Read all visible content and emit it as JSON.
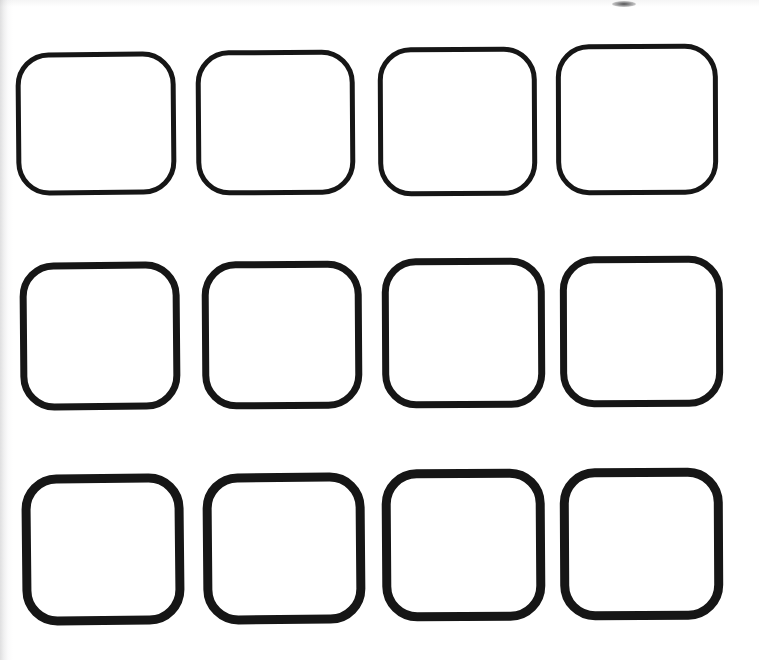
{
  "document": {
    "kind": "scanned-worksheet",
    "title": "Blank rounded-square grid template",
    "background_color": "#ffffff",
    "ink_color": "#161616",
    "page_width": 759,
    "page_height": 660,
    "rows": 3,
    "columns": 4,
    "shape_count": 12,
    "shape_type": "rounded-square-outline",
    "shape_fill": "none"
  },
  "artifacts": {
    "left_edge_shadow": "scan shadow, vertical gray gradient on left margin",
    "top_edge_shadow": "scan shadow, faint gray band at top margin",
    "top_smudge": {
      "label": "ink speck",
      "x": 612,
      "y": 1,
      "width": 24,
      "height": 6
    }
  },
  "grid": {
    "rows": [
      {
        "index": 0,
        "label": "row-1",
        "stroke_width": 5,
        "cells": [
          {
            "label": "cell-r1c1",
            "x": 16,
            "y": 52,
            "width": 160,
            "height": 143,
            "radius": 33,
            "rotation": -0.5
          },
          {
            "label": "cell-r1c2",
            "x": 196,
            "y": 50,
            "width": 159,
            "height": 145,
            "radius": 33,
            "rotation": -0.4
          },
          {
            "label": "cell-r1c3",
            "x": 378,
            "y": 47,
            "width": 159,
            "height": 149,
            "radius": 33,
            "rotation": -0.3
          },
          {
            "label": "cell-r1c4",
            "x": 556,
            "y": 44,
            "width": 162,
            "height": 151,
            "radius": 33,
            "rotation": -0.2
          }
        ]
      },
      {
        "index": 1,
        "label": "row-2",
        "stroke_width": 7,
        "cells": [
          {
            "label": "cell-r2c1",
            "x": 20,
            "y": 262,
            "width": 160,
            "height": 148,
            "radius": 34,
            "rotation": -0.5
          },
          {
            "label": "cell-r2c2",
            "x": 202,
            "y": 261,
            "width": 160,
            "height": 148,
            "radius": 34,
            "rotation": -0.4
          },
          {
            "label": "cell-r2c3",
            "x": 382,
            "y": 258,
            "width": 163,
            "height": 150,
            "radius": 34,
            "rotation": -0.3
          },
          {
            "label": "cell-r2c4",
            "x": 560,
            "y": 256,
            "width": 163,
            "height": 151,
            "radius": 34,
            "rotation": -0.2
          }
        ]
      },
      {
        "index": 2,
        "label": "row-3",
        "stroke_width": 9,
        "cells": [
          {
            "label": "cell-r3c1",
            "x": 22,
            "y": 474,
            "width": 162,
            "height": 151,
            "radius": 35,
            "rotation": -0.6
          },
          {
            "label": "cell-r3c2",
            "x": 203,
            "y": 473,
            "width": 162,
            "height": 151,
            "radius": 35,
            "rotation": -0.5
          },
          {
            "label": "cell-r3c3",
            "x": 382,
            "y": 469,
            "width": 163,
            "height": 152,
            "radius": 35,
            "rotation": -0.4
          },
          {
            "label": "cell-r3c4",
            "x": 560,
            "y": 468,
            "width": 163,
            "height": 152,
            "radius": 35,
            "rotation": -0.3
          }
        ]
      }
    ]
  }
}
